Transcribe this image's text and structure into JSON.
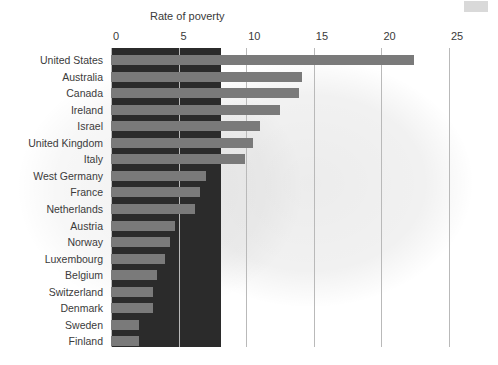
{
  "chart": {
    "title": "Rate of poverty",
    "x_ticks": [
      "0",
      "5",
      "10",
      "15",
      "20",
      "25"
    ]
  },
  "chart_data": {
    "type": "bar",
    "orientation": "horizontal",
    "title": "Rate of poverty",
    "xlabel": "Rate of poverty",
    "ylabel": "",
    "xlim": [
      0,
      25
    ],
    "grid": true,
    "legend": "none",
    "categories": [
      "United States",
      "Australia",
      "Canada",
      "Ireland",
      "Israel",
      "United Kingdom",
      "Italy",
      "West Germany",
      "France",
      "Netherlands",
      "Austria",
      "Norway",
      "Luxembourg",
      "Belgium",
      "Switzerland",
      "Denmark",
      "Sweden",
      "Finland"
    ],
    "values": [
      22.4,
      14.1,
      13.9,
      12.5,
      11.0,
      10.5,
      9.9,
      7.0,
      6.6,
      6.2,
      4.7,
      4.4,
      4.0,
      3.4,
      3.1,
      3.1,
      2.1,
      2.1
    ],
    "tick_labels": [
      "0",
      "5",
      "10",
      "15",
      "20",
      "25"
    ],
    "colors": {
      "bar": "#7a7a7a",
      "panel": "#2b2b2b",
      "gridline": "#b9b9b9",
      "background": "#ffffff",
      "text": "#3b3b3b"
    }
  }
}
